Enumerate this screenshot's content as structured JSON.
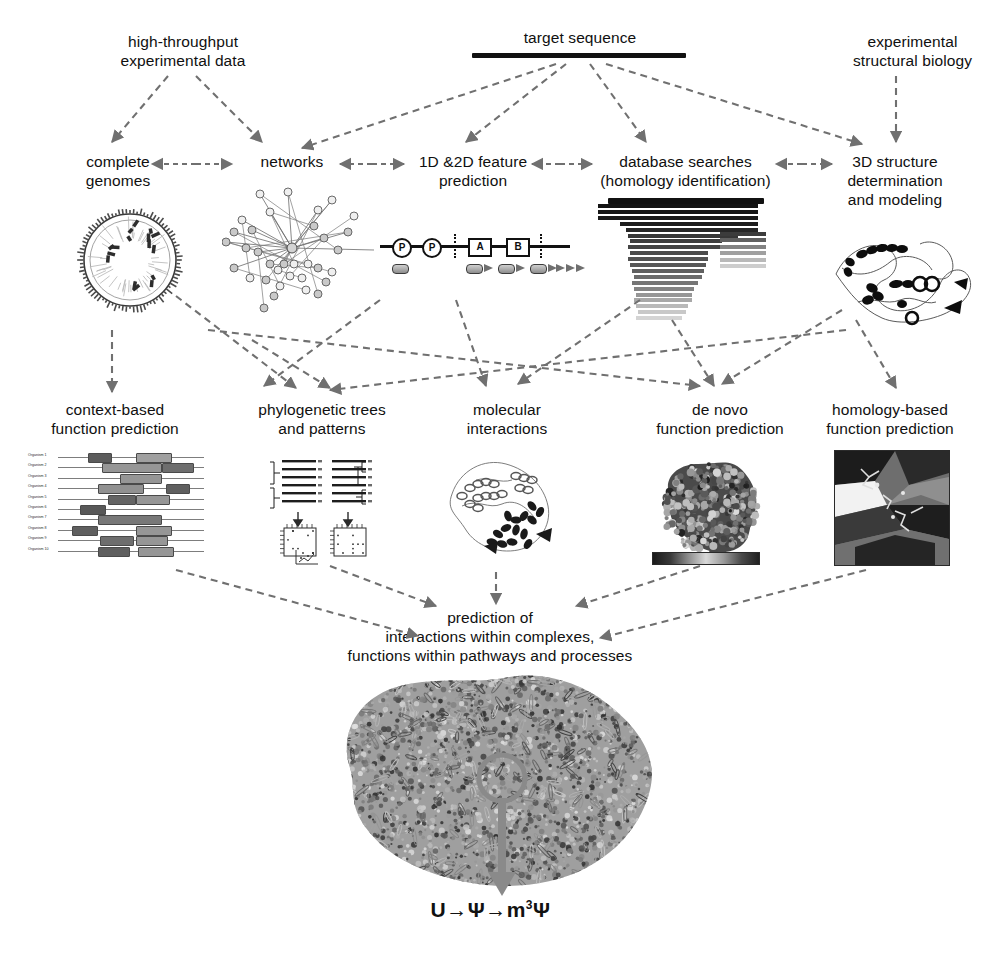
{
  "diagram": {
    "title": "target sequence",
    "row1": [
      {
        "id": "high-throughput",
        "text": "high-throughput\nexperimental data",
        "x": 88,
        "y": 32,
        "w": 190
      },
      {
        "id": "target-sequence",
        "text": "target sequence",
        "x": 470,
        "y": 28,
        "w": 220
      },
      {
        "id": "experimental-structural-biology",
        "text": "experimental\nstructural biology",
        "x": 820,
        "y": 32,
        "w": 185
      }
    ],
    "row2": [
      {
        "id": "complete-genomes",
        "text": "complete\ngenomes",
        "x": 58,
        "y": 152,
        "w": 120
      },
      {
        "id": "networks",
        "text": "networks",
        "x": 232,
        "y": 152,
        "w": 120
      },
      {
        "id": "feature-prediction",
        "text": "1D &2D feature\nprediction",
        "x": 398,
        "y": 152,
        "w": 150
      },
      {
        "id": "database-searches",
        "text": "database searches\n(homology identification)",
        "x": 578,
        "y": 152,
        "w": 215
      },
      {
        "id": "structure-determination",
        "text": "3D structure\ndetermination\nand modeling",
        "x": 820,
        "y": 152,
        "w": 150
      }
    ],
    "row3": [
      {
        "id": "context-based",
        "text": "context-based\nfunction prediction",
        "x": 20,
        "y": 400,
        "w": 190
      },
      {
        "id": "phylogenetic-trees",
        "text": "phylogenetic trees\nand patterns",
        "x": 232,
        "y": 400,
        "w": 180
      },
      {
        "id": "molecular-interactions",
        "text": "molecular\ninteractions",
        "x": 432,
        "y": 400,
        "w": 150
      },
      {
        "id": "de-novo",
        "text": "de novo\nfunction prediction",
        "x": 630,
        "y": 400,
        "w": 180
      },
      {
        "id": "homology-based",
        "text": "homology-based\nfunction prediction",
        "x": 800,
        "y": 400,
        "w": 180
      }
    ],
    "conclusion": {
      "id": "prediction-summary",
      "text": "prediction of\ninteractions within complexes,\nfunctions within pathways and processes",
      "x": 250,
      "y": 608,
      "w": 480
    },
    "chem_annotation": {
      "pre": "U→Ψ→m",
      "sup": "3",
      "post": "Ψ"
    }
  },
  "panels": {
    "genome": {
      "name": "circular-genome-map",
      "ticks": 84,
      "inner_rays": 46
    },
    "network": {
      "name": "protein-interaction-network",
      "nodes": 34,
      "hub_edges": 14
    },
    "features": {
      "name": "sequence-feature-track",
      "site_labels": [
        "P",
        "P"
      ],
      "domain_labels": [
        "A",
        "B"
      ],
      "elements": [
        1,
        3,
        3
      ]
    },
    "blast": {
      "name": "blast-hit-bars",
      "bars": [
        {
          "x": 0,
          "w": 160,
          "g": 20
        },
        {
          "x": 0,
          "w": 160,
          "g": 22
        },
        {
          "x": 0,
          "w": 160,
          "g": 25
        },
        {
          "x": 22,
          "w": 138,
          "g": 30
        },
        {
          "x": 28,
          "w": 132,
          "g": 38
        },
        {
          "x": 30,
          "w": 110,
          "g": 55
        },
        {
          "x": 32,
          "w": 92,
          "g": 62
        },
        {
          "x": 30,
          "w": 98,
          "g": 68
        },
        {
          "x": 32,
          "w": 78,
          "g": 75
        },
        {
          "x": 30,
          "w": 80,
          "g": 82
        },
        {
          "x": 32,
          "w": 76,
          "g": 88
        },
        {
          "x": 34,
          "w": 72,
          "g": 96
        },
        {
          "x": 36,
          "w": 68,
          "g": 108
        },
        {
          "x": 34,
          "w": 66,
          "g": 118
        },
        {
          "x": 36,
          "w": 60,
          "g": 132
        },
        {
          "x": 38,
          "w": 56,
          "g": 150
        },
        {
          "x": 36,
          "w": 58,
          "g": 168
        },
        {
          "x": 38,
          "w": 52,
          "g": 185
        },
        {
          "x": 40,
          "w": 48,
          "g": 200
        },
        {
          "x": 38,
          "w": 46,
          "g": 212
        }
      ],
      "right_bars": [
        {
          "g": 60
        },
        {
          "g": 96
        },
        {
          "g": 130
        },
        {
          "g": 160
        },
        {
          "g": 185
        },
        {
          "g": 205
        }
      ]
    },
    "structure3d": {
      "name": "protein-ribbon-cartoon"
    },
    "context": {
      "name": "gene-neighborhood-alignment",
      "organism_labels": [
        "Organism 1",
        "Organism 2",
        "Organism 3",
        "Organism 4",
        "Organism 5",
        "Organism 6",
        "Organism 7",
        "Organism 8",
        "Organism 9",
        "Organism 10"
      ],
      "rows": [
        [
          {
            "x": 30,
            "w": 22,
            "g": 92
          },
          {
            "x": 78,
            "w": 34,
            "g": 160
          }
        ],
        [
          {
            "x": 44,
            "w": 58,
            "g": 150
          },
          {
            "x": 104,
            "w": 30,
            "g": 110
          }
        ],
        [
          {
            "x": 62,
            "w": 40,
            "g": 150
          }
        ],
        [
          {
            "x": 40,
            "w": 44,
            "g": 145
          },
          {
            "x": 108,
            "w": 22,
            "g": 95
          }
        ],
        [
          {
            "x": 50,
            "w": 26,
            "g": 100
          },
          {
            "x": 78,
            "w": 32,
            "g": 150
          }
        ],
        [
          {
            "x": 22,
            "w": 24,
            "g": 88
          }
        ],
        [
          {
            "x": 40,
            "w": 62,
            "g": 120
          }
        ],
        [
          {
            "x": 14,
            "w": 24,
            "g": 95
          },
          {
            "x": 78,
            "w": 34,
            "g": 150
          }
        ],
        [
          {
            "x": 42,
            "w": 32,
            "g": 110
          },
          {
            "x": 78,
            "w": 30,
            "g": 150
          }
        ],
        [
          {
            "x": 40,
            "w": 30,
            "g": 95
          },
          {
            "x": 80,
            "w": 34,
            "g": 150
          }
        ]
      ]
    },
    "phylo": {
      "name": "phylogenetic-tree-and-matrix",
      "alignments": 2,
      "matrices": 2
    },
    "interactions": {
      "name": "molecular-complex-ribbon"
    },
    "denovo": {
      "name": "molecular-surface-model",
      "has_colorbar": true
    },
    "homology": {
      "name": "homology-model-closeup"
    },
    "ribosome": {
      "name": "ribosome-structure",
      "callout": "modification-site-circle"
    }
  },
  "colors": {
    "arrow": "#707070",
    "text": "#101010",
    "bar_dark": "#111111",
    "callout": "#8a8a8a"
  }
}
